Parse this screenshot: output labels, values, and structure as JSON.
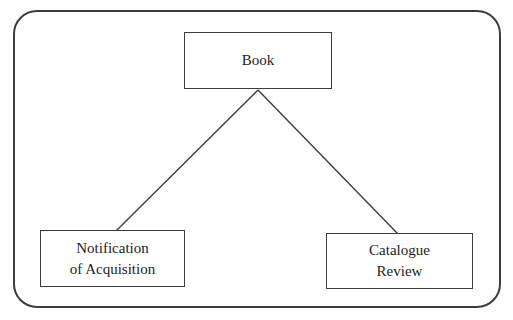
{
  "diagram": {
    "nodes": {
      "book": {
        "label": "Book"
      },
      "notification": {
        "label": "Notification\nof Acquisition"
      },
      "catalogue": {
        "label": "Catalogue\nReview"
      }
    },
    "edges": [
      {
        "from": "book",
        "to": "notification"
      },
      {
        "from": "book",
        "to": "catalogue"
      }
    ],
    "colors": {
      "line": "#3d3d3d",
      "box_border": "#3d3d3d",
      "box_fill": "#ffffff",
      "text": "#1d1d1d",
      "background": "#ffffff"
    }
  }
}
